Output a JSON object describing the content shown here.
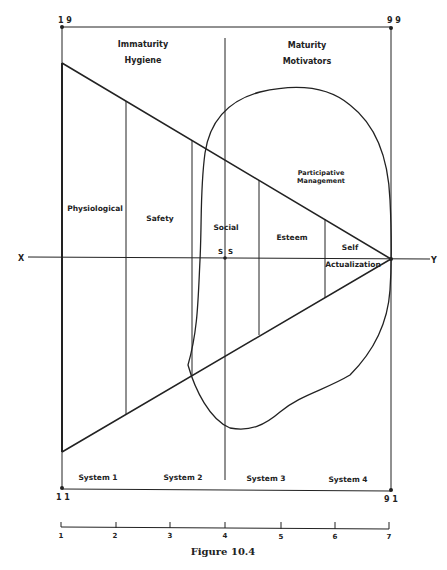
{
  "figure": {
    "caption": "Figure 10.4",
    "corners": {
      "top_left": "1 9",
      "top_right": "9 9",
      "bottom_left": "1 1",
      "bottom_right": "9 1"
    },
    "axis": {
      "x_label": "X",
      "y_label": "Y",
      "center_label_left": "S",
      "center_label_right": "S"
    },
    "top_left_labels": [
      "Immaturity",
      "Hygiene"
    ],
    "top_right_labels": [
      "Maturity",
      "Motivators"
    ],
    "needs": [
      "Physiological",
      "Safety",
      "Social",
      "Esteem",
      "Self",
      "Actualization"
    ],
    "blob_labels": [
      "Participative",
      "Management"
    ],
    "systems": [
      "System 1",
      "System 2",
      "System 3",
      "System 4"
    ],
    "ruler_ticks": [
      "1",
      "2",
      "3",
      "4",
      "5",
      "6",
      "7"
    ]
  },
  "colors": {
    "line": "#222222",
    "background": "#ffffff"
  }
}
